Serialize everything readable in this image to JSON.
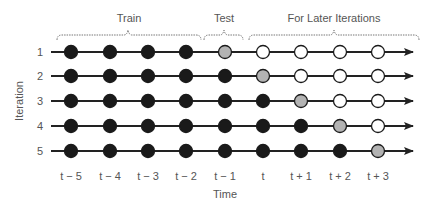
{
  "diagram": {
    "title": "",
    "xlabel": "Time",
    "ylabel": "Iteration",
    "brackets": [
      {
        "label": "Train",
        "from_col": 0,
        "to_col": 3
      },
      {
        "label": "Test",
        "from_col": 4,
        "to_col": 4
      },
      {
        "label": "For Later Iterations",
        "from_col": 5,
        "to_col": 8
      }
    ],
    "time_labels": [
      "t − 5",
      "t − 4",
      "t − 3",
      "t − 2",
      "t − 1",
      "t",
      "t + 1",
      "t + 2",
      "t + 3"
    ],
    "iteration_labels": [
      "1",
      "2",
      "3",
      "4",
      "5"
    ],
    "legend_states": {
      "black": "train",
      "gray": "test",
      "white": "later"
    },
    "colors": {
      "train": "#1a1a1a",
      "test": "#b3b3b3",
      "later": "#ffffff",
      "line": "#222222",
      "text": "#555555"
    },
    "grid": [
      [
        "black",
        "black",
        "black",
        "black",
        "gray",
        "white",
        "white",
        "white",
        "white"
      ],
      [
        "black",
        "black",
        "black",
        "black",
        "black",
        "gray",
        "white",
        "white",
        "white"
      ],
      [
        "black",
        "black",
        "black",
        "black",
        "black",
        "black",
        "gray",
        "white",
        "white"
      ],
      [
        "black",
        "black",
        "black",
        "black",
        "black",
        "black",
        "black",
        "gray",
        "white"
      ],
      [
        "black",
        "black",
        "black",
        "black",
        "black",
        "black",
        "black",
        "black",
        "gray"
      ]
    ]
  }
}
